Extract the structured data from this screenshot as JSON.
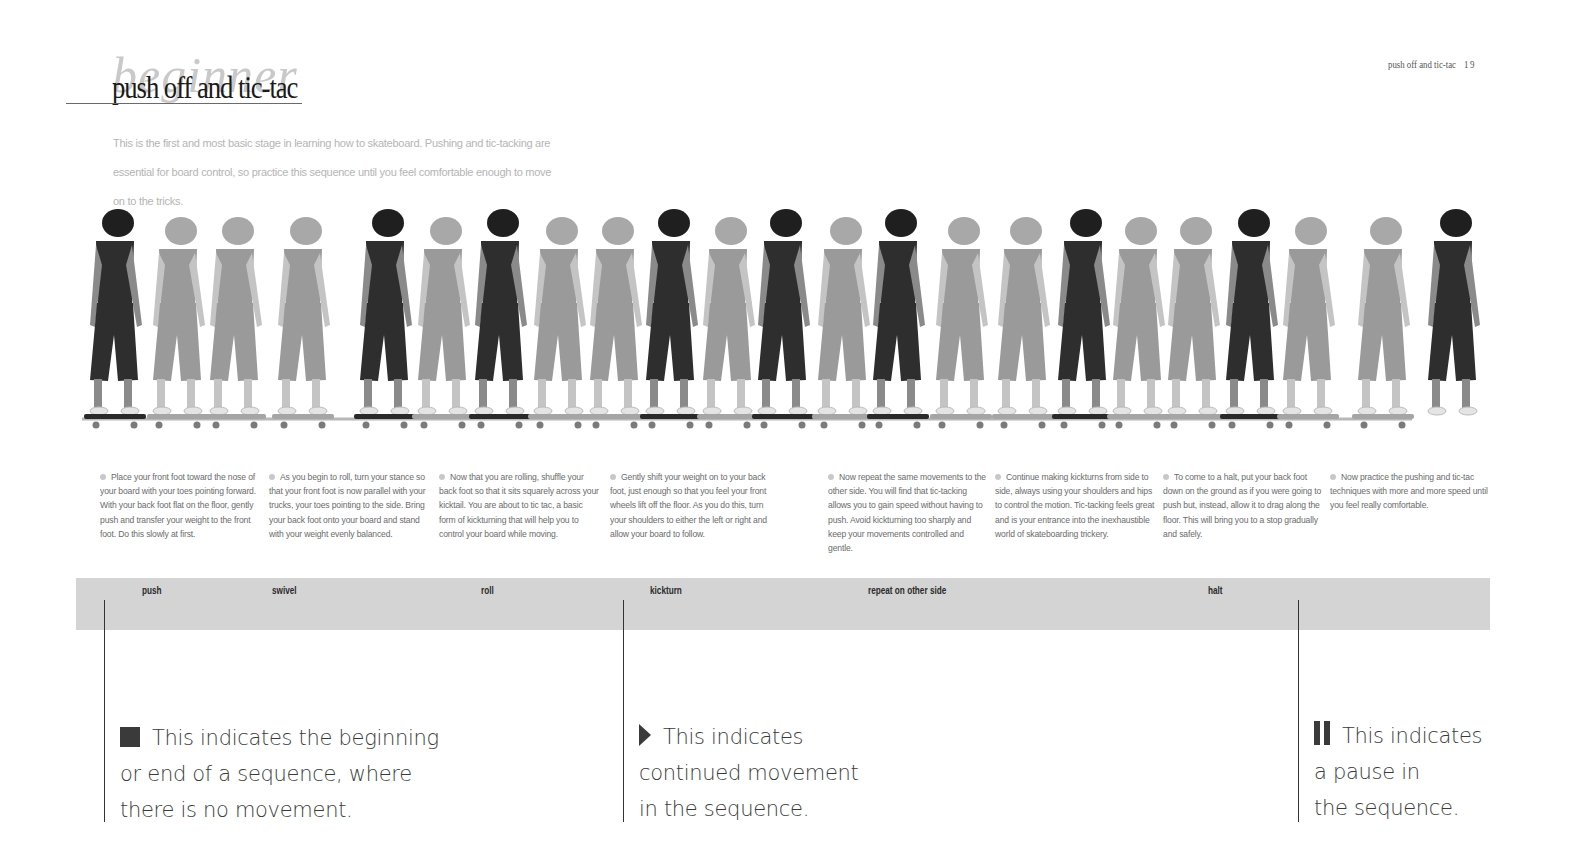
{
  "header": {
    "watermark": "beginner",
    "title": "push off and tic-tac",
    "running_head": "push off and tic-tac",
    "page_number": "19"
  },
  "intro": "This is the first and most basic stage in learning how to skateboard. Pushing and tic-tacking are essential for board control, so practice this sequence until you feel comfortable enough to move on to the tricks.",
  "photo_strip": {
    "description": "sequence of a girl in helmet pushing off and tic-tacking on a skateboard",
    "figures": [
      {
        "x": 30,
        "tone": "dark"
      },
      {
        "x": 93,
        "tone": "light"
      },
      {
        "x": 150,
        "tone": "light"
      },
      {
        "x": 218,
        "tone": "light"
      },
      {
        "x": 300,
        "tone": "dark"
      },
      {
        "x": 358,
        "tone": "light"
      },
      {
        "x": 415,
        "tone": "dark"
      },
      {
        "x": 474,
        "tone": "light"
      },
      {
        "x": 530,
        "tone": "light"
      },
      {
        "x": 586,
        "tone": "dark"
      },
      {
        "x": 643,
        "tone": "light"
      },
      {
        "x": 698,
        "tone": "dark"
      },
      {
        "x": 758,
        "tone": "light"
      },
      {
        "x": 813,
        "tone": "dark"
      },
      {
        "x": 876,
        "tone": "light"
      },
      {
        "x": 938,
        "tone": "light"
      },
      {
        "x": 998,
        "tone": "dark"
      },
      {
        "x": 1053,
        "tone": "light"
      },
      {
        "x": 1108,
        "tone": "light"
      },
      {
        "x": 1166,
        "tone": "dark"
      },
      {
        "x": 1223,
        "tone": "light"
      },
      {
        "x": 1298,
        "tone": "light"
      },
      {
        "x": 1368,
        "tone": "dark"
      }
    ]
  },
  "steps": [
    {
      "text": "Place your front foot toward the nose of your board with your toes pointing forward. With your back foot flat on the floor, gently push and transfer your weight to the front foot. Do this slowly at first."
    },
    {
      "text": "As you begin to roll, turn your stance so that your front foot is now parallel with your trucks, your toes pointing to the side. Bring your back foot onto your board and stand with your weight evenly balanced."
    },
    {
      "text": "Now that you are rolling, shuffle your back foot so that it sits squarely across your kicktail. You are about to tic tac, a basic form of kickturning that will help you to control your board while moving."
    },
    {
      "text": "Gently shift your weight on to your back foot, just enough so that you feel your front wheels lift off the floor. As you do this, turn your shoulders to either the left or right and allow your board to follow."
    },
    {
      "text": "Now repeat the same movements to the other side. You will find that tic-tacking allows you to gain speed without having to push. Avoid kickturning too sharply and keep your movements controlled and gentle."
    },
    {
      "text": "Continue making kickturns from side to side, always using your shoulders and hips to control the motion. Tic-tacking feels great and is your entrance into the inexhaustible world of skateboarding trickery."
    },
    {
      "text": "To come to a halt, put your back foot down on the ground as if you were going to push but, instead, allow it to drag along the floor. This will bring you to a stop gradually and safely."
    },
    {
      "text": "Now practice the pushing and tic-tac techniques with more and more speed until you feel really comfortable."
    }
  ],
  "sequence_bar": {
    "labels": [
      "push",
      "swivel",
      "roll",
      "kickturn",
      "repeat on other side",
      "halt"
    ],
    "color": "#d4d4d4"
  },
  "legend": [
    {
      "icon": "stop-square-icon",
      "text_lines": [
        "This indicates the beginning",
        "or end of a sequence, where",
        "there is no movement."
      ]
    },
    {
      "icon": "play-triangle-icon",
      "text_lines": [
        "This indicates",
        "continued movement",
        "in the sequence."
      ]
    },
    {
      "icon": "pause-bars-icon",
      "text_lines": [
        "This indicates",
        "a pause in",
        "the sequence."
      ]
    }
  ]
}
